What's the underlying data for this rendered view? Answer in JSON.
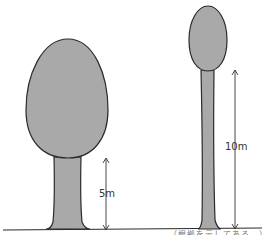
{
  "diagram": {
    "title": "",
    "colors": {
      "fill": "#a9a9a9",
      "outline": "#2a2a2a",
      "background": "#ffffff"
    },
    "trees": [
      {
        "name": "short-wide-tree",
        "trunk_height_label": "5m",
        "shape": "large oval crown, thick trunk"
      },
      {
        "name": "tall-thin-tree",
        "trunk_height_label": "10m",
        "shape": "small egg crown, thin tall trunk"
      }
    ],
    "ground": "horizontal ground line",
    "caption": "…（根拠を示してある…）"
  }
}
